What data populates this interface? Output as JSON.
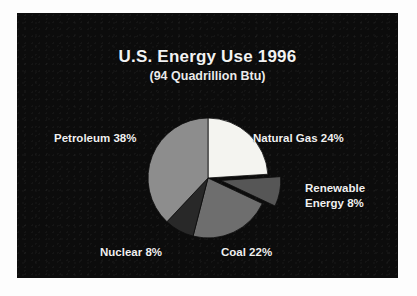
{
  "slide": {
    "background_color": "#0c0c0c",
    "page_color": "#fdfdfd"
  },
  "chart_data": {
    "type": "pie",
    "title": "U.S. Energy Use 1996",
    "subtitle": "(94 Quadrillion Btu)",
    "total_label": "94 Quadrillion Btu",
    "units": "Quadrillion Btu",
    "total_value": 94,
    "year": 1996,
    "xlabel": "",
    "ylabel": "",
    "legend_position": "none",
    "labels_position": "outside-callout",
    "grid": false,
    "start_angle_deg": 0,
    "direction": "clockwise",
    "categories": [
      "Natural Gas",
      "Renewable Energy",
      "Coal",
      "Nuclear",
      "Petroleum"
    ],
    "values": [
      24,
      8,
      22,
      8,
      38
    ],
    "slices": [
      {
        "name": "Natural Gas",
        "value": 24,
        "label": "Natural Gas 24%",
        "percent_text": "24%",
        "color": "#f4f4f0",
        "exploded": false,
        "start_deg": 0,
        "end_deg": 86.4
      },
      {
        "name": "Renewable Energy",
        "value": 8,
        "label": "Renewable Energy 8%",
        "label_line1": "Renewable",
        "label_line2": "Energy 8%",
        "percent_text": "8%",
        "color": "#565656",
        "exploded": true,
        "start_deg": 86.4,
        "end_deg": 115.2
      },
      {
        "name": "Coal",
        "value": 22,
        "label": "Coal 22%",
        "percent_text": "22%",
        "color": "#6e6e6e",
        "exploded": false,
        "start_deg": 115.2,
        "end_deg": 194.4
      },
      {
        "name": "Nuclear",
        "value": 8,
        "label": "Nuclear 8%",
        "percent_text": "8%",
        "color": "#282828",
        "exploded": false,
        "start_deg": 194.4,
        "end_deg": 223.2
      },
      {
        "name": "Petroleum",
        "value": 38,
        "label": "Petroleum 38%",
        "percent_text": "38%",
        "color": "#8d8d8d",
        "exploded": false,
        "start_deg": 223.2,
        "end_deg": 360
      }
    ]
  }
}
